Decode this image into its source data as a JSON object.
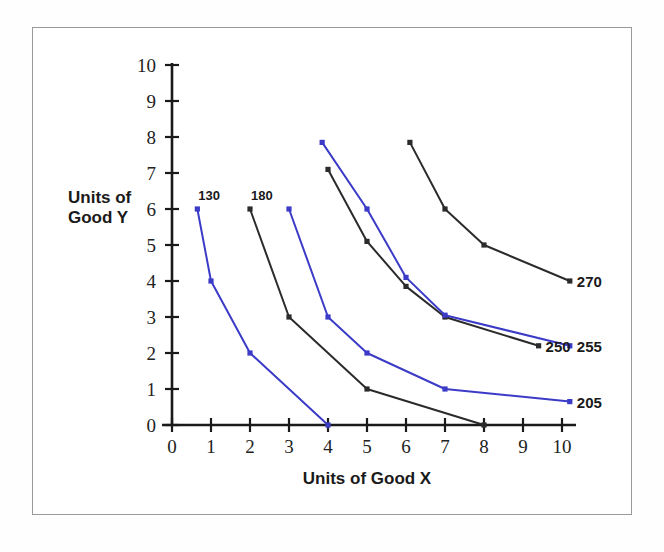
{
  "chart_data": {
    "type": "line",
    "title": "",
    "subtitle": "",
    "xlabel": "Units of Good X",
    "ylabel": "Units of Good Y",
    "xlim": [
      0,
      10
    ],
    "ylim": [
      0,
      10
    ],
    "xticks": [
      "0",
      "1",
      "2",
      "3",
      "4",
      "5",
      "6",
      "7",
      "8",
      "9",
      "10"
    ],
    "yticks": [
      "0",
      "1",
      "2",
      "3",
      "4",
      "5",
      "6",
      "7",
      "8",
      "9",
      "10"
    ],
    "grid": false,
    "legend": "inline-end-labels",
    "colors": {
      "blue": "#3b3bc8",
      "black": "#2b2b2b",
      "axis": "#1a1a1a",
      "frame": "#9a9a9a",
      "background": "#ffffff"
    },
    "series": [
      {
        "name": "130",
        "color": "blue",
        "label": "130",
        "label_position": "start-top",
        "points": [
          [
            0.65,
            6.0
          ],
          [
            1.0,
            4.0
          ],
          [
            2.0,
            2.0
          ],
          [
            4.0,
            0.0
          ]
        ]
      },
      {
        "name": "180",
        "color": "black",
        "label": "180",
        "label_position": "start-top",
        "points": [
          [
            2.0,
            6.0
          ],
          [
            3.0,
            3.0
          ],
          [
            5.0,
            1.0
          ],
          [
            8.0,
            0.0
          ]
        ]
      },
      {
        "name": "205",
        "color": "blue",
        "label": "205",
        "label_position": "end-right",
        "points": [
          [
            3.0,
            6.0
          ],
          [
            4.0,
            3.0
          ],
          [
            5.0,
            2.0
          ],
          [
            7.0,
            1.0
          ],
          [
            10.2,
            0.65
          ]
        ]
      },
      {
        "name": "250",
        "color": "black",
        "label": "250",
        "label_position": "end-right",
        "points": [
          [
            4.0,
            7.1
          ],
          [
            5.0,
            5.1
          ],
          [
            6.0,
            3.85
          ],
          [
            7.0,
            3.0
          ],
          [
            9.4,
            2.2
          ]
        ]
      },
      {
        "name": "255",
        "color": "blue",
        "label": "255",
        "label_position": "end-right",
        "points": [
          [
            3.85,
            7.85
          ],
          [
            5.0,
            6.0
          ],
          [
            6.0,
            4.1
          ],
          [
            7.0,
            3.05
          ],
          [
            10.2,
            2.2
          ]
        ]
      },
      {
        "name": "270",
        "color": "black",
        "label": "270",
        "label_position": "end-right",
        "points": [
          [
            6.1,
            7.85
          ],
          [
            7.0,
            6.0
          ],
          [
            8.0,
            5.0
          ],
          [
            10.2,
            4.0
          ]
        ]
      }
    ]
  },
  "axis": {
    "y_title_line1": "Units of",
    "y_title_line2": "Good Y",
    "x_title": "Units of Good X"
  }
}
